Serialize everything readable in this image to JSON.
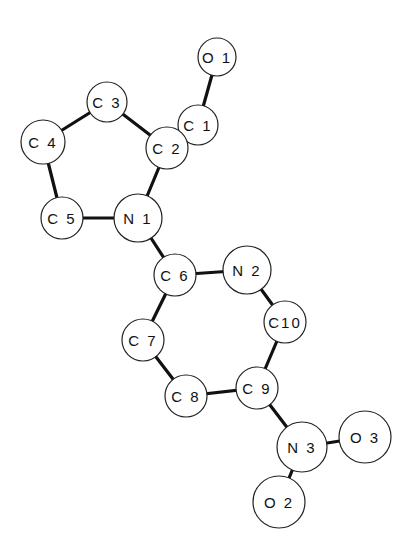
{
  "diagram": {
    "type": "molecular-structure",
    "atoms": [
      {
        "id": "O1",
        "label": "O 1",
        "x": 217,
        "y": 57,
        "r": 19
      },
      {
        "id": "C1",
        "label": "C 1",
        "x": 198,
        "y": 125,
        "r": 20
      },
      {
        "id": "C2",
        "label": "C 2",
        "x": 167,
        "y": 148,
        "r": 21
      },
      {
        "id": "C3",
        "label": "C 3",
        "x": 107,
        "y": 102,
        "r": 20
      },
      {
        "id": "C4",
        "label": "C 4",
        "x": 43,
        "y": 142,
        "r": 22
      },
      {
        "id": "C5",
        "label": "C 5",
        "x": 62,
        "y": 218,
        "r": 21
      },
      {
        "id": "N1",
        "label": "N 1",
        "x": 138,
        "y": 218,
        "r": 24
      },
      {
        "id": "C6",
        "label": "C 6",
        "x": 175,
        "y": 275,
        "r": 21
      },
      {
        "id": "N2",
        "label": "N 2",
        "x": 247,
        "y": 270,
        "r": 24
      },
      {
        "id": "C10",
        "label": "C10",
        "x": 285,
        "y": 322,
        "r": 21
      },
      {
        "id": "C7",
        "label": "C 7",
        "x": 143,
        "y": 340,
        "r": 21
      },
      {
        "id": "C8",
        "label": "C 8",
        "x": 186,
        "y": 396,
        "r": 21
      },
      {
        "id": "C9",
        "label": "C 9",
        "x": 257,
        "y": 388,
        "r": 21
      },
      {
        "id": "N3",
        "label": "N 3",
        "x": 302,
        "y": 447,
        "r": 25
      },
      {
        "id": "O3",
        "label": "O 3",
        "x": 365,
        "y": 437,
        "r": 26
      },
      {
        "id": "O2",
        "label": "O 2",
        "x": 279,
        "y": 502,
        "r": 26
      }
    ],
    "bonds": [
      [
        "O1",
        "C1"
      ],
      [
        "C1",
        "C2"
      ],
      [
        "C2",
        "C3"
      ],
      [
        "C3",
        "C4"
      ],
      [
        "C4",
        "C5"
      ],
      [
        "C5",
        "N1"
      ],
      [
        "N1",
        "C2"
      ],
      [
        "N1",
        "C6"
      ],
      [
        "C6",
        "N2"
      ],
      [
        "N2",
        "C10"
      ],
      [
        "C10",
        "C9"
      ],
      [
        "C9",
        "C8"
      ],
      [
        "C8",
        "C7"
      ],
      [
        "C7",
        "C6"
      ],
      [
        "C9",
        "N3"
      ],
      [
        "N3",
        "O3"
      ],
      [
        "N3",
        "O2"
      ]
    ]
  }
}
